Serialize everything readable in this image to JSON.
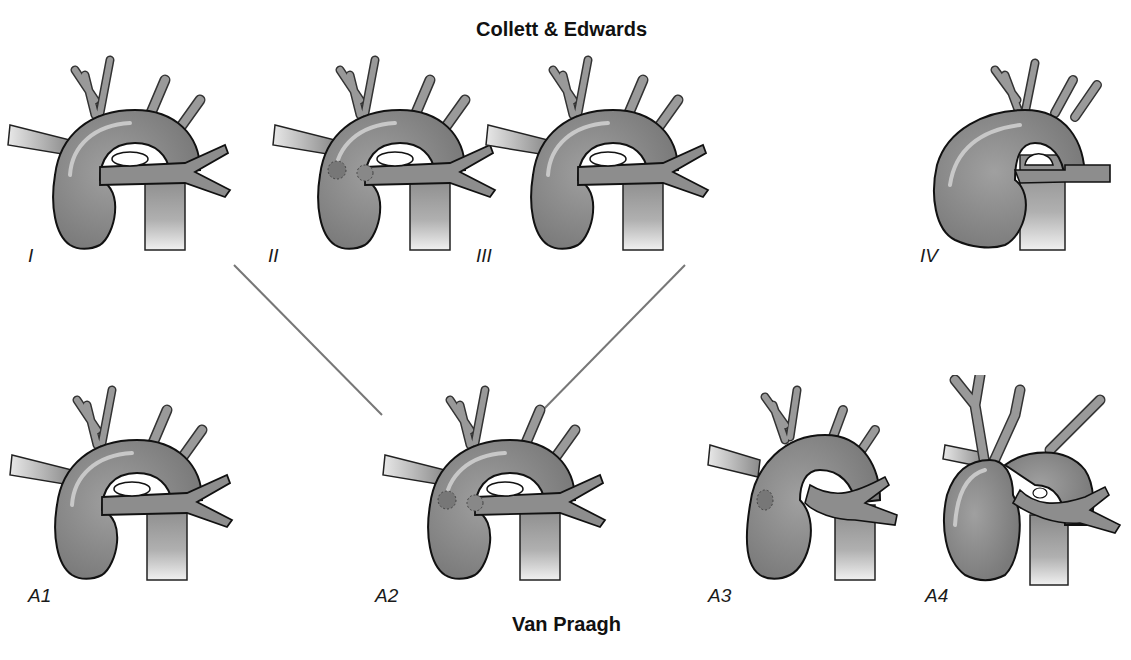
{
  "diagram": {
    "top_title": "Collett & Edwards",
    "bottom_title": "Van Praagh",
    "colors": {
      "vessel_fill": "#8a8a8a",
      "vessel_outline": "#111111",
      "connector": "#777777",
      "background": "#ffffff"
    },
    "collett_edwards_types": [
      {
        "id": "I",
        "label": "I",
        "description": "main pulmonary artery arises from truncus"
      },
      {
        "id": "II",
        "label": "II",
        "description": "branch pulmonary arteries arise close together from posterior truncus"
      },
      {
        "id": "III",
        "label": "III",
        "description": "branch pulmonary arteries arise separately from truncus"
      },
      {
        "id": "IV",
        "label": "IV",
        "description": "pulmonary arteries arise from descending aorta"
      }
    ],
    "van_praagh_types": [
      {
        "id": "A1",
        "label": "A1"
      },
      {
        "id": "A2",
        "label": "A2"
      },
      {
        "id": "A3",
        "label": "A3"
      },
      {
        "id": "A4",
        "label": "A4"
      }
    ],
    "connections": [
      {
        "from": "II",
        "to": "A2"
      },
      {
        "from": "III",
        "to": "A2"
      }
    ]
  }
}
